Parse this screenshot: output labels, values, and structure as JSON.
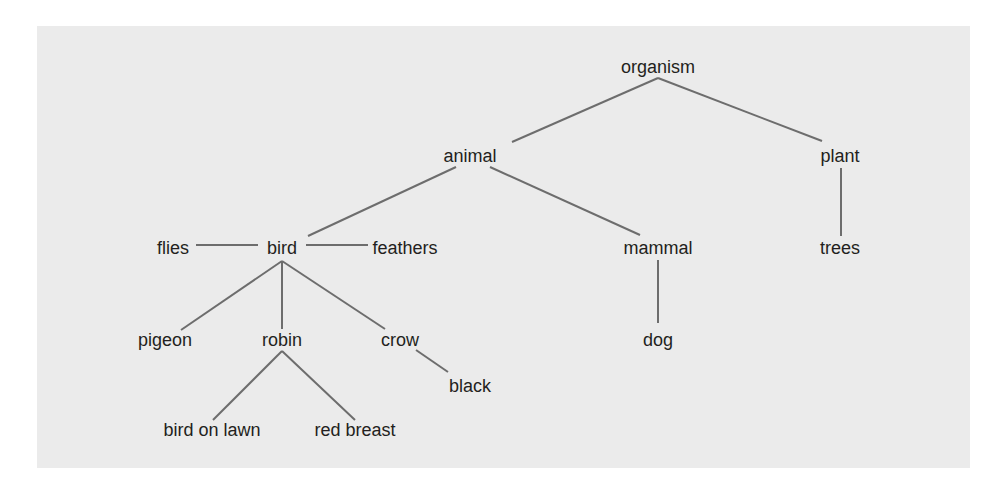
{
  "diagram": {
    "type": "semantic network / hierarchy",
    "background_color": "#ebebeb",
    "line_color": "#6d6d6d",
    "text_color": "#231f20",
    "nodes": [
      {
        "id": "organism",
        "label": "organism",
        "x": 658,
        "y": 67
      },
      {
        "id": "animal",
        "label": "animal",
        "x": 470,
        "y": 156
      },
      {
        "id": "plant",
        "label": "plant",
        "x": 840,
        "y": 156
      },
      {
        "id": "bird",
        "label": "bird",
        "x": 282,
        "y": 248
      },
      {
        "id": "flies",
        "label": "flies",
        "x": 173,
        "y": 248
      },
      {
        "id": "feathers",
        "label": "feathers",
        "x": 405,
        "y": 248
      },
      {
        "id": "mammal",
        "label": "mammal",
        "x": 658,
        "y": 248
      },
      {
        "id": "trees",
        "label": "trees",
        "x": 840,
        "y": 248
      },
      {
        "id": "pigeon",
        "label": "pigeon",
        "x": 165,
        "y": 340
      },
      {
        "id": "robin",
        "label": "robin",
        "x": 282,
        "y": 340
      },
      {
        "id": "crow",
        "label": "crow",
        "x": 400,
        "y": 340
      },
      {
        "id": "dog",
        "label": "dog",
        "x": 658,
        "y": 340
      },
      {
        "id": "black",
        "label": "black",
        "x": 470,
        "y": 386
      },
      {
        "id": "bird_on_lawn",
        "label": "bird on lawn",
        "x": 212,
        "y": 430
      },
      {
        "id": "red_breast",
        "label": "red breast",
        "x": 355,
        "y": 430
      }
    ],
    "edges": [
      {
        "from": [
          658,
          78
        ],
        "to": [
          512,
          142
        ]
      },
      {
        "from": [
          658,
          78
        ],
        "to": [
          822,
          141
        ]
      },
      {
        "from": [
          456,
          167
        ],
        "to": [
          308,
          236
        ]
      },
      {
        "from": [
          490,
          167
        ],
        "to": [
          640,
          235
        ]
      },
      {
        "from": [
          841,
          168
        ],
        "to": [
          841,
          236
        ]
      },
      {
        "from": [
          196,
          245
        ],
        "to": [
          258,
          245
        ]
      },
      {
        "from": [
          306,
          245
        ],
        "to": [
          368,
          245
        ]
      },
      {
        "from": [
          282,
          261
        ],
        "to": [
          181,
          330
        ]
      },
      {
        "from": [
          282,
          261
        ],
        "to": [
          282,
          329
        ]
      },
      {
        "from": [
          282,
          261
        ],
        "to": [
          385,
          329
        ]
      },
      {
        "from": [
          658,
          260
        ],
        "to": [
          658,
          323
        ]
      },
      {
        "from": [
          416,
          350
        ],
        "to": [
          448,
          372
        ]
      },
      {
        "from": [
          282,
          351
        ],
        "to": [
          213,
          420
        ]
      },
      {
        "from": [
          282,
          351
        ],
        "to": [
          355,
          420
        ]
      }
    ]
  }
}
